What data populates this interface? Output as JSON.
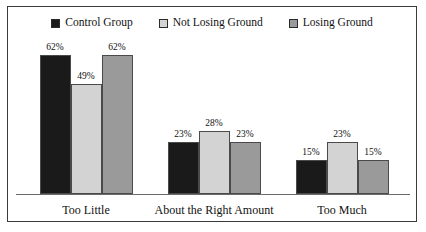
{
  "chart_data": {
    "type": "bar",
    "title": "",
    "subtitle": "",
    "xlabel": "",
    "ylabel": "",
    "ylim": [
      0,
      70
    ],
    "grid": false,
    "legend_position": "top",
    "value_suffix": "%",
    "categories": [
      "Too Little",
      "About the Right Amount",
      "Too Much"
    ],
    "series": [
      {
        "name": "Control Group",
        "color": "#1a1a1a",
        "values": [
          62,
          23,
          15
        ],
        "labels": [
          "62%",
          "23%",
          "15%"
        ]
      },
      {
        "name": "Not Losing Ground",
        "color": "#d3d3d3",
        "values": [
          49,
          28,
          23
        ],
        "labels": [
          "49%",
          "28%",
          "23%"
        ]
      },
      {
        "name": "Losing Ground",
        "color": "#9a9a9a",
        "values": [
          62,
          23,
          15
        ],
        "labels": [
          "62%",
          "23%",
          "15%"
        ]
      }
    ]
  },
  "legend": {
    "items": [
      {
        "label": "Control Group",
        "swatch": "legend-swatch-control-group",
        "color": "#1a1a1a"
      },
      {
        "label": "Not Losing Ground",
        "swatch": "legend-swatch-not-losing-ground",
        "color": "#d3d3d3"
      },
      {
        "label": "Losing Ground",
        "swatch": "legend-swatch-losing-ground",
        "color": "#9a9a9a"
      }
    ]
  },
  "colors": {
    "control_group": "#1a1a1a",
    "not_losing_ground": "#d3d3d3",
    "losing_ground": "#9a9a9a",
    "border": "#3a3a3a",
    "axis": "#6b6b6b",
    "background": "#ffffff",
    "text": "#111111"
  }
}
